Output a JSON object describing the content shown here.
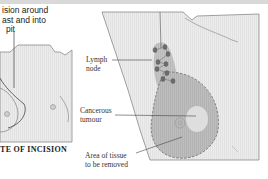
{
  "figure": {
    "left_panel": {
      "incision_label": {
        "line1": "ision around",
        "line2": "ast and into",
        "line3": "pit"
      },
      "caption": "TE OF INCISION"
    },
    "right_panel": {
      "labels": {
        "lymph_node": {
          "line1": "Lymph",
          "line2": "node"
        },
        "tumour": {
          "line1": "Cancerous",
          "line2": "tumour"
        },
        "area_removed": {
          "line1": "Area of tissue",
          "line2": "to be removed"
        }
      }
    },
    "colors": {
      "background": "#ffffff",
      "panel_fill": "#e8e8e8",
      "outline": "#8a8a8a",
      "tissue_fill": "#bdbdbd",
      "tumour_fill": "#dedede",
      "node_fill": "#6e6e6e",
      "text": "#333333"
    }
  }
}
